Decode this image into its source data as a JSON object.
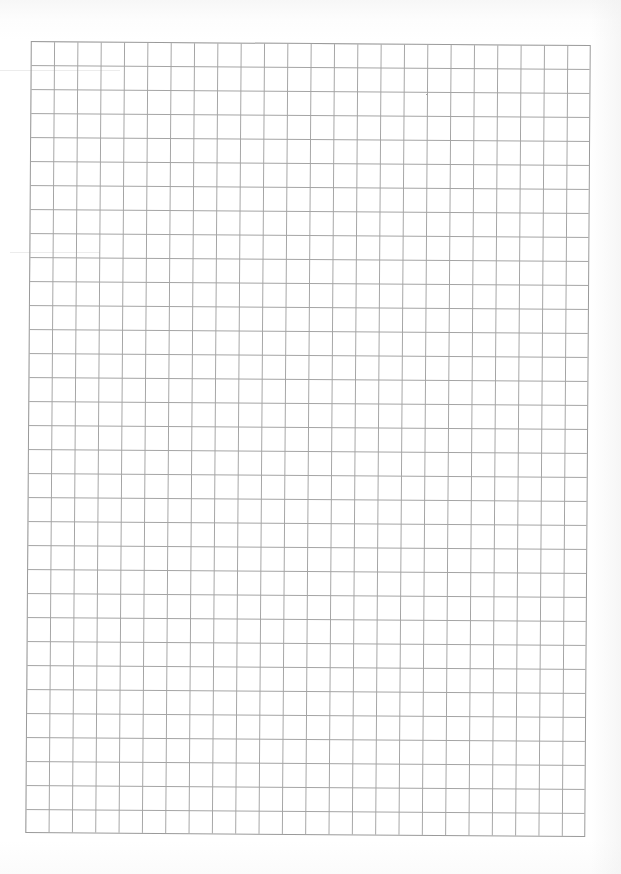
{
  "document": {
    "type": "grid-paper",
    "grid": {
      "columns": 24,
      "rows": 33,
      "line_color": "#a4a4a4",
      "border_color": "#9a9a9a",
      "background": "#ffffff"
    }
  }
}
